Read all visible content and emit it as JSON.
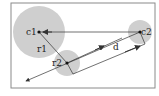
{
  "diagram": {
    "frame": {
      "x": 11,
      "y": 3,
      "w": 144,
      "h": 85,
      "stroke": "#8a8a8a"
    },
    "circles": [
      {
        "id": "c1",
        "label": "c1",
        "cx": 39,
        "cy": 32,
        "r": 26,
        "fill": "#cfcfcf"
      },
      {
        "id": "r2-circle",
        "label": "",
        "cx": 67,
        "cy": 63,
        "r": 13,
        "fill": "#cfcfcf"
      },
      {
        "id": "c2",
        "label": "c2",
        "cx": 140,
        "cy": 32,
        "r": 12,
        "fill": "#cfcfcf"
      }
    ],
    "labels": {
      "c1": "c1",
      "c2": "c2",
      "r1": "r1",
      "r2": "r2",
      "d": "d"
    },
    "colors": {
      "line": "#333333",
      "circle": "#cfcfcf",
      "frame": "#8a8a8a"
    }
  }
}
